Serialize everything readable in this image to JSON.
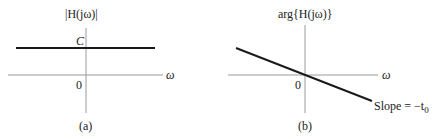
{
  "figure": {
    "panels": [
      {
        "id": "a",
        "ylabel": "|H(jω)|",
        "xlabel": "ω",
        "level_label": "C",
        "origin_label": "0",
        "caption": "(a)"
      },
      {
        "id": "b",
        "ylabel": "arg{H(jω)}",
        "xlabel": "ω",
        "origin_label": "0",
        "slope_label": "Slope = −t",
        "slope_subscript": "0",
        "caption": "(b)"
      }
    ]
  },
  "colors": {
    "axis": "#9a9a9a",
    "curve": "#1a1a1a",
    "text": "#222222"
  }
}
